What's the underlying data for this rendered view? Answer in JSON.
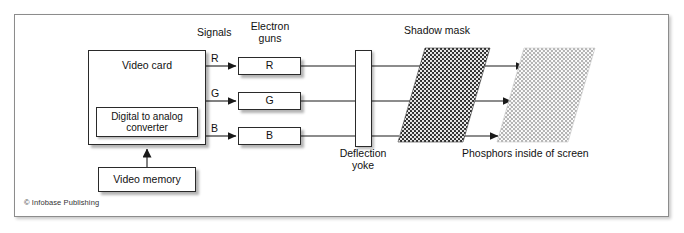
{
  "figure": {
    "caption_copyright": "© Infobase Publishing",
    "colors": {
      "frame_border": "#8c8c8c",
      "box_border": "#2a2a2a",
      "line": "#1a1a1a",
      "shadow_mask_fill": "#262626",
      "phosphor_fill": "#b9b9b9",
      "background": "#ffffff"
    }
  },
  "boxes": {
    "video_card": "Video card",
    "dac": "Digital to analog\nconverter",
    "video_memory": "Video memory",
    "gun_r": "R",
    "gun_g": "G",
    "gun_b": "B",
    "yoke": ""
  },
  "labels": {
    "signals": "Signals",
    "electron_guns": "Electron\nguns",
    "shadow_mask": "Shadow mask",
    "deflection_yoke": "Deflection\nyoke",
    "phosphors": "Phosphors inside of screen"
  },
  "signal_labels": {
    "r": "R",
    "g": "G",
    "b": "B"
  }
}
